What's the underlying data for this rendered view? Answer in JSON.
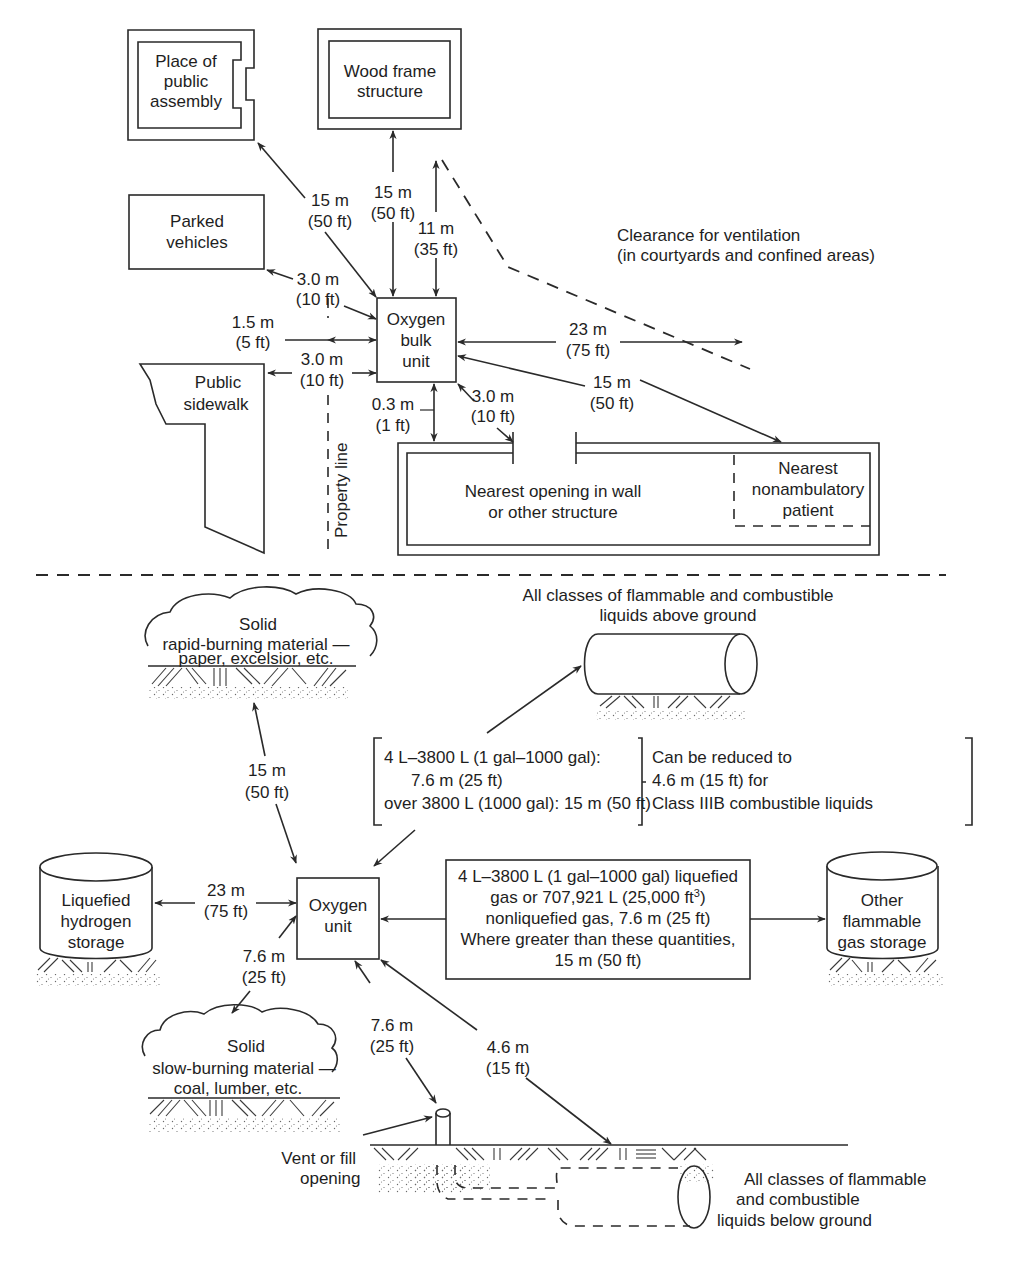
{
  "colors": {
    "ink": "#1e1e1e",
    "background": "#ffffff"
  },
  "upper_section": {
    "title": "Oxygen bulk unit clearances (upper plan)",
    "oxygen_unit": {
      "lines": [
        "Oxygen",
        "bulk",
        "unit"
      ]
    },
    "places": {
      "public_assembly": [
        "Place of",
        "public",
        "assembly"
      ],
      "wood_frame": [
        "Wood frame",
        "structure"
      ],
      "parked_vehicles": [
        "Parked",
        "vehicles"
      ],
      "public_sidewalk": [
        "Public",
        "sidewalk"
      ],
      "nearest_opening": [
        "Nearest opening in wall",
        "or other structure"
      ],
      "nonambulatory_patient": [
        "Nearest",
        "nonambulatory",
        "patient"
      ],
      "ventilation_clearance": [
        "Clearance for ventilation",
        "(in courtyards and confined areas)"
      ],
      "property_line": "Property line"
    },
    "distances": {
      "public_assembly": [
        "15 m",
        "(50 ft)"
      ],
      "wood_frame": [
        "15 m",
        "(50 ft)"
      ],
      "ventilation_up": [
        "11 m",
        "(35 ft)"
      ],
      "parked_vehicles": [
        "3.0 m",
        "(10 ft)"
      ],
      "property_line": [
        "1.5 m",
        "(5 ft)"
      ],
      "public_sidewalk": [
        "3.0 m",
        "(10 ft)"
      ],
      "ventilation_right": [
        "23 m",
        "(75 ft)"
      ],
      "nonambulatory": [
        "15 m",
        "(50 ft)"
      ],
      "opening": [
        "3.0 m",
        "(10 ft)"
      ],
      "structure_wall": [
        "0.3 m",
        "(1 ft)"
      ]
    }
  },
  "lower_section": {
    "oxygen_unit": {
      "lines": [
        "Oxygen",
        "unit"
      ]
    },
    "places": {
      "rapid_burning": [
        "Solid",
        "rapid-burning material —",
        "paper, excelsior, etc."
      ],
      "liquids_above": [
        "All classes of flammable and combustible",
        "liquids above ground"
      ],
      "liquefied_hydrogen": [
        "Liquefied",
        "hydrogen",
        "storage"
      ],
      "other_gas": [
        "Other",
        "flammable",
        "gas storage"
      ],
      "slow_burning": [
        "Solid",
        "slow-burning material —",
        "coal, lumber, etc."
      ],
      "vent_fill": [
        "Vent or fill",
        "opening"
      ],
      "liquids_below": [
        "All classes of flammable",
        "and combustible",
        "liquids below ground"
      ]
    },
    "liquid_rules": {
      "left_lines": [
        "4 L–3800 L (1 gal–1000 gal):",
        "7.6 m (25 ft)",
        "over 3800 L (1000 gal): 15 m (50 ft)"
      ],
      "right_lines": [
        "Can be reduced to",
        "4.6 m (15 ft) for",
        "Class IIIB combustible liquids"
      ]
    },
    "gas_rules": {
      "line1": "4 L–3800 L (1 gal–1000 gal) liquefied",
      "line2_pre": "gas or 707,921 L (25,000 ft",
      "line2_sup": "3",
      "line2_post": ")",
      "line3": "nonliquefied gas, 7.6 m (25 ft)",
      "line4": "Where greater than these quantities,",
      "line5": "15 m (50 ft)"
    },
    "distances": {
      "rapid_burning": [
        "15 m",
        "(50 ft)"
      ],
      "liquefied_hydrogen": [
        "23 m",
        "(75 ft)"
      ],
      "slow_burning": [
        "7.6 m",
        "(25 ft)"
      ],
      "vent_fill": [
        "7.6 m",
        "(25 ft)"
      ],
      "liquids_below": [
        "4.6 m",
        "(15 ft)"
      ]
    }
  }
}
